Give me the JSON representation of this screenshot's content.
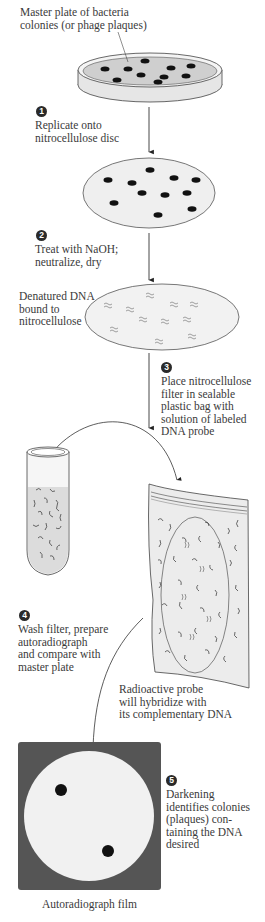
{
  "figure": {
    "labels": {
      "master_plate": "Master plate of bacteria\ncolonies (or phage plaques)",
      "denatured_dna": "Denatured DNA\nbound to\nnitrocellulose",
      "radioactive_probe": "Radioactive probe\nwill hybridize with\nits complementary DNA",
      "film": "Autoradiograph film"
    },
    "steps": [
      {
        "number": "1",
        "text": "Replicate onto\nnitrocellulose disc"
      },
      {
        "number": "2",
        "text": "Treat with NaOH;\nneutralize, dry"
      },
      {
        "number": "3",
        "text": "Place nitrocellulose\nfilter in sealable\nplastic bag with\nsolution of labeled\nDNA probe"
      },
      {
        "number": "4",
        "text": "Wash filter, prepare\nautoradiograph\nand compare with\nmaster plate"
      },
      {
        "number": "5",
        "text": "Darkening\nidentifies colonies\n(plaques) con-\ntaining the DNA\ndesired"
      }
    ],
    "colors": {
      "film_background": "#555555",
      "film_disc": "#f1f1f1",
      "disc_fill": "#f0f0f0",
      "plate_agar": "#cfcfcf",
      "dot": "#111111",
      "line": "#333333"
    }
  }
}
